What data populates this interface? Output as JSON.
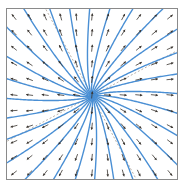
{
  "figure": {
    "title": "",
    "background_color": "#ffffff",
    "frame_color": "#8a8a8a",
    "streamline_color": "#4a8fd4",
    "arrow_color": "#3a3530",
    "eigenline_color": "#9b8f82",
    "width": 185,
    "height": 188
  },
  "chart_data": {
    "type": "scatter",
    "subtype": "phase-portrait-slope-field",
    "title": "",
    "xlabel": "",
    "ylabel": "",
    "xlim": [
      -1.0,
      1.0
    ],
    "ylim": [
      -1.0,
      1.0
    ],
    "grid": false,
    "legend": null,
    "tick_labels_x": [],
    "tick_labels_y": [],
    "annotations": [],
    "plot_box_px": {
      "left": 6,
      "top": 8,
      "right": 178,
      "bottom": 180
    },
    "critical_point": {
      "label": "node",
      "type": "improper node (attracting/repelling star-like)",
      "x_px": 92,
      "y_px": 96,
      "x_data": 0.0,
      "y_data": 0.0
    },
    "eigen_directions_deg": [
      28,
      208,
      118,
      298
    ],
    "streamline_count": 28,
    "streamline_angles_deg": [
      0,
      13,
      26,
      39,
      52,
      64,
      77,
      90,
      103,
      116,
      129,
      141,
      154,
      167,
      180,
      193,
      206,
      219,
      232,
      244,
      257,
      270,
      283,
      296,
      309,
      321,
      334,
      347
    ],
    "streamline_curvature": 0.42,
    "vector_grid": {
      "cols": 11,
      "rows": 11,
      "spacing_px": 15.6,
      "origin_px": [
        14,
        17
      ],
      "tick_length_px": 7
    },
    "series": [
      {
        "name": "streamlines",
        "color": "#4a8fd4",
        "linewidth": 1.4
      },
      {
        "name": "direction-field",
        "color": "#3a3530",
        "linewidth": 0.8
      },
      {
        "name": "eigenvector-lines",
        "color": "#9b8f82",
        "linewidth": 0.7,
        "dash": "2,2"
      }
    ]
  }
}
